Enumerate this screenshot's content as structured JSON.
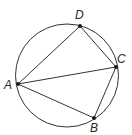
{
  "diagram": {
    "type": "inscribed-quadrilateral",
    "circle": {
      "cx": 67,
      "cy": 75.5,
      "r": 51.5,
      "stroke": "#333333"
    },
    "points": [
      {
        "id": "A",
        "label": "A",
        "x": 18,
        "y": 84,
        "lx": 4,
        "ly": 89
      },
      {
        "id": "B",
        "label": "B",
        "x": 94,
        "y": 118,
        "lx": 90,
        "ly": 132
      },
      {
        "id": "C",
        "label": "C",
        "x": 116,
        "y": 67,
        "lx": 117,
        "ly": 63
      },
      {
        "id": "D",
        "label": "D",
        "x": 80,
        "y": 26,
        "lx": 75,
        "ly": 19
      }
    ],
    "segments": [
      [
        "A",
        "D"
      ],
      [
        "D",
        "C"
      ],
      [
        "C",
        "B"
      ],
      [
        "B",
        "A"
      ],
      [
        "A",
        "C"
      ]
    ],
    "line_color": "#333333",
    "point_color": "#1a1a1a"
  }
}
